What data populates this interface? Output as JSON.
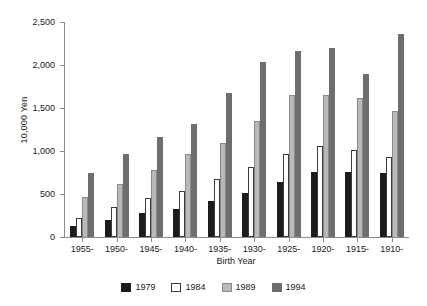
{
  "chart_data": {
    "type": "bar",
    "title": "",
    "xlabel": "Birth Year",
    "ylabel": "10,000 Yen",
    "categories": [
      "1955-",
      "1950-",
      "1945-",
      "1940-",
      "1935-",
      "1930-",
      "1925-",
      "1920-",
      "1915-",
      "1910-"
    ],
    "ylim": [
      0,
      2500
    ],
    "yticks": [
      0,
      500,
      1000,
      1500,
      2000,
      2500
    ],
    "ytick_labels": [
      "0",
      "500",
      "1,000",
      "1,500",
      "2,000",
      "2,500"
    ],
    "grid": false,
    "legend_position": "bottom",
    "series": [
      {
        "name": "1979",
        "color": "#1c1c1c",
        "values": [
          130,
          200,
          280,
          330,
          420,
          510,
          640,
          760,
          760,
          750
        ]
      },
      {
        "name": "1984",
        "color": "#ffffff",
        "values": [
          220,
          350,
          450,
          540,
          680,
          810,
          960,
          1060,
          1010,
          930
        ]
      },
      {
        "name": "1989",
        "color": "#b9b9b9",
        "values": [
          470,
          620,
          780,
          960,
          1090,
          1350,
          1650,
          1650,
          1620,
          1470
        ]
      },
      {
        "name": "1994",
        "color": "#6e6e6e",
        "values": [
          750,
          960,
          1160,
          1310,
          1670,
          2040,
          2160,
          2200,
          1890,
          2360
        ]
      }
    ]
  }
}
